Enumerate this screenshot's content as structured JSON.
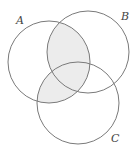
{
  "diagram": {
    "type": "venn",
    "sets": [
      {
        "label": "A",
        "cx": 49,
        "cy": 62,
        "r": 41,
        "label_x": 16,
        "label_y": 24
      },
      {
        "label": "B",
        "cx": 88,
        "cy": 52,
        "r": 41,
        "label_x": 121,
        "label_y": 20
      },
      {
        "label": "C",
        "cx": 78,
        "cy": 103,
        "r": 41,
        "label_x": 111,
        "label_y": 142
      }
    ],
    "shaded_region": "A ∩ (B ∪ C)",
    "colors": {
      "stroke": "#7a7a7a",
      "shade": "#ececec",
      "background": "#ffffff"
    }
  }
}
